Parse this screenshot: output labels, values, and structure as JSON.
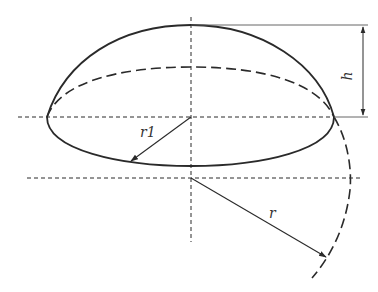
{
  "diagram": {
    "labels": {
      "h": "h",
      "r1": "r1",
      "r": "r"
    },
    "colors": {
      "stroke": "#2a2a2a",
      "background": "#ffffff"
    },
    "elements": [
      {
        "name": "cap-outline",
        "style": "solid"
      },
      {
        "name": "base-circle-back",
        "style": "dashed"
      },
      {
        "name": "base-circle-front",
        "style": "solid"
      },
      {
        "name": "sphere-arc",
        "style": "dashed"
      },
      {
        "name": "vertical-axis",
        "style": "dashed"
      },
      {
        "name": "base-plane-axis",
        "style": "dashed"
      },
      {
        "name": "sphere-center-axis",
        "style": "dashed"
      },
      {
        "name": "height-dimension",
        "label": "h"
      },
      {
        "name": "base-radius-arrow",
        "label": "r1"
      },
      {
        "name": "sphere-radius-arrow",
        "label": "r"
      }
    ]
  }
}
